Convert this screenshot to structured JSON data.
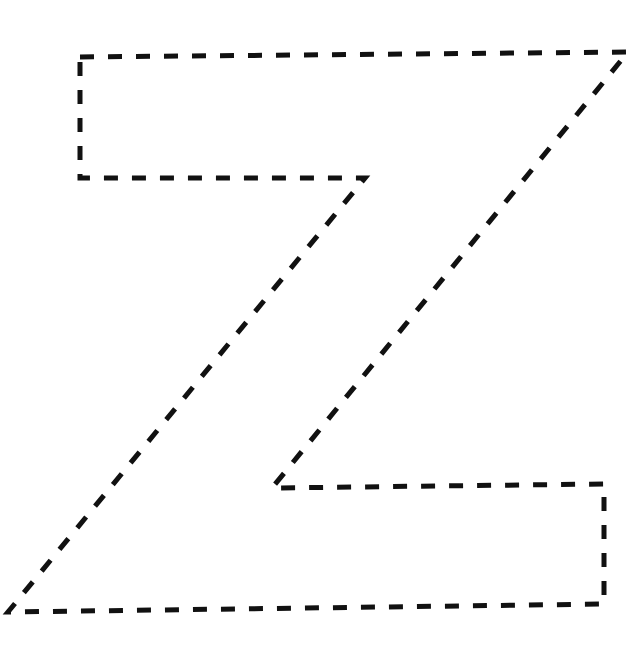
{
  "figure": {
    "letter": "Z",
    "stroke_color": "#111111",
    "background_color": "#ffffff",
    "outline_points": [
      [
        80,
        57
      ],
      [
        628,
        52
      ],
      [
        272,
        488
      ],
      [
        604,
        484
      ],
      [
        604,
        604
      ],
      [
        8,
        612
      ],
      [
        365,
        178
      ],
      [
        80,
        178
      ]
    ]
  }
}
